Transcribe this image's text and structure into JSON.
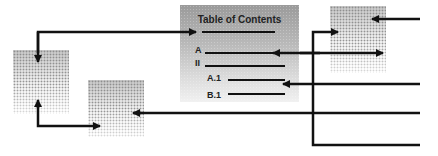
{
  "toc": {
    "title": "Table of Contents",
    "entries": [
      "A",
      "II",
      "A.1",
      "B.1"
    ]
  },
  "colors": {
    "line": "#111111",
    "toc_gradient_top": "#9a9a9a",
    "toc_gradient_bottom": "#f1f1f1"
  }
}
